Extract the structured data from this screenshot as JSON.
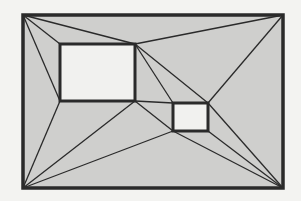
{
  "diagram": {
    "type": "polygon-triangulation-with-holes",
    "colors": {
      "background": "#f3f3f1",
      "fill": "#cfcfcd",
      "hole_fill": "#f1f1ef",
      "stroke": "#2a2a2a"
    },
    "outer": {
      "x": 23,
      "y": 15,
      "w": 260,
      "h": 173
    },
    "holes": [
      {
        "id": "large-hole",
        "x": 60,
        "y": 44,
        "w": 75,
        "h": 57
      },
      {
        "id": "small-hole",
        "x": 173,
        "y": 103,
        "w": 35,
        "h": 28
      }
    ],
    "edges": [
      [
        23,
        15,
        60,
        44
      ],
      [
        23,
        15,
        135,
        44
      ],
      [
        23,
        15,
        60,
        101
      ],
      [
        283,
        15,
        135,
        44
      ],
      [
        283,
        15,
        208,
        103
      ],
      [
        135,
        44,
        173,
        103
      ],
      [
        135,
        44,
        208,
        103
      ],
      [
        135,
        101,
        173,
        103
      ],
      [
        135,
        101,
        173,
        131
      ],
      [
        23,
        188,
        60,
        101
      ],
      [
        23,
        188,
        135,
        101
      ],
      [
        23,
        188,
        173,
        131
      ],
      [
        283,
        188,
        173,
        131
      ],
      [
        283,
        188,
        208,
        131
      ],
      [
        283,
        188,
        208,
        103
      ]
    ]
  }
}
